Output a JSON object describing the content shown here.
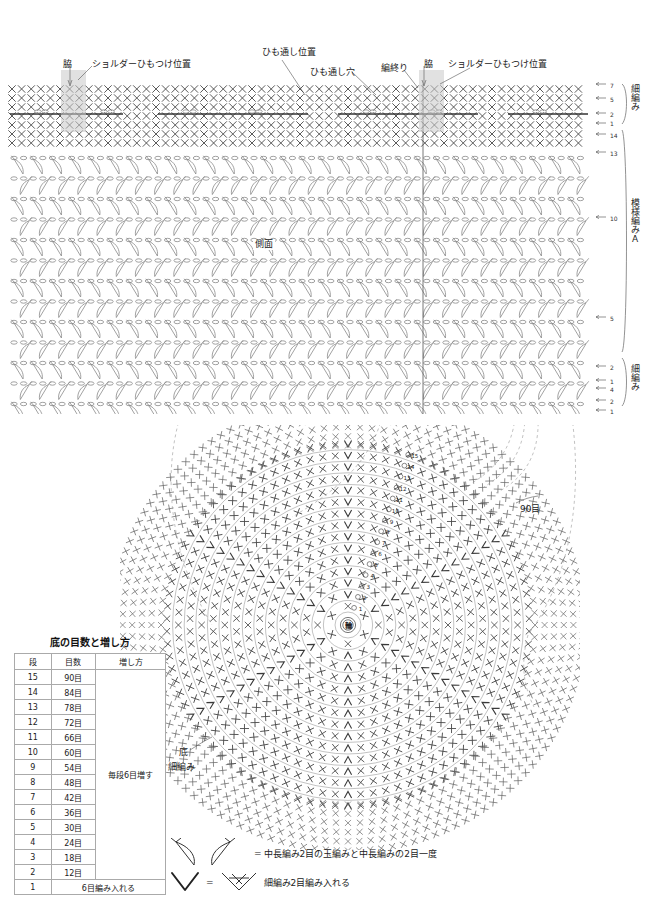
{
  "document": {
    "title": "かぎ針編みバッグ 編み図",
    "language": "ja"
  },
  "body_chart": {
    "annotations": [
      {
        "id": "side-left",
        "text": "脇",
        "x": 63,
        "y": 62
      },
      {
        "id": "shoulder-left",
        "text": "ショルダーひもつけ位置",
        "x": 92,
        "y": 62
      },
      {
        "id": "cord-position",
        "text": "ひも通し位置",
        "x": 262,
        "y": 50
      },
      {
        "id": "cord-hole",
        "text": "ひも通し穴",
        "x": 316,
        "y": 70
      },
      {
        "id": "knit-end",
        "text": "編終り",
        "x": 383,
        "y": 65
      },
      {
        "id": "side-right",
        "text": "脇",
        "x": 424,
        "y": 62
      },
      {
        "id": "shoulder-right",
        "text": "ショルダーひもつけ位置",
        "x": 448,
        "y": 62
      },
      {
        "id": "side-face",
        "text": "側面",
        "x": 253,
        "y": 243
      }
    ],
    "labels": {
      "side": "脇",
      "side_face": "側面"
    }
  },
  "row_legend": {
    "sections": [
      {
        "id": "top-single-crochet",
        "label": "細編み",
        "rows": [
          "7",
          "5",
          "2",
          "1"
        ]
      },
      {
        "id": "pattern-a",
        "label": "模様編みA",
        "rows": [
          "14",
          "13",
          "10",
          "5",
          "2",
          "1"
        ]
      },
      {
        "id": "bottom-single-crochet",
        "label": "細編み",
        "rows": [
          "4",
          "2",
          "1"
        ]
      }
    ]
  },
  "base_chart": {
    "center_label": "輪",
    "ring_labels": [
      "1",
      "2",
      "3",
      "4",
      "5",
      "6",
      "7",
      "8",
      "9",
      "10",
      "11",
      "12",
      "13",
      "14",
      "15"
    ],
    "stitch_count_label": "90目",
    "bottom_label": "底",
    "bottom_stitch_label": "細編み"
  },
  "count_table": {
    "title": "底の目数と増し方",
    "headers": [
      "段",
      "目数",
      "増し方"
    ],
    "increase_note": "毎段6目増す",
    "rows": [
      {
        "row": "15",
        "count": "90目"
      },
      {
        "row": "14",
        "count": "84目"
      },
      {
        "row": "13",
        "count": "78目"
      },
      {
        "row": "12",
        "count": "72目"
      },
      {
        "row": "11",
        "count": "66目"
      },
      {
        "row": "10",
        "count": "60目"
      },
      {
        "row": "9",
        "count": "54目"
      },
      {
        "row": "8",
        "count": "48目"
      },
      {
        "row": "7",
        "count": "42目"
      },
      {
        "row": "6",
        "count": "36目"
      },
      {
        "row": "5",
        "count": "30目"
      },
      {
        "row": "4",
        "count": "24目"
      },
      {
        "row": "3",
        "count": "18目"
      },
      {
        "row": "2",
        "count": "12目"
      }
    ],
    "first_row": {
      "row": "1",
      "text": "6目編み入れる"
    }
  },
  "symbol_legend": {
    "entries": [
      {
        "id": "half-double-cluster",
        "equals": "=",
        "text": "中長編み2目の玉編みと中長編みの2目一度"
      },
      {
        "id": "two-sc-in-one",
        "equals": "=",
        "text": "細編み2目編み入れる"
      }
    ]
  },
  "colors": {
    "ink": "#222222",
    "stitch": "#4a4a4a",
    "light_stitch": "#8a8a8a",
    "shade": "#c9c9c9",
    "guide": "#999999"
  }
}
